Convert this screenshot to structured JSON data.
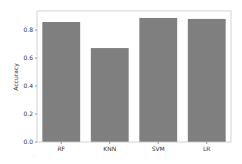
{
  "chart_data": {
    "type": "bar",
    "title": "",
    "xlabel": "",
    "ylabel": "Accuracy",
    "categories": [
      "RF",
      "KNN",
      "SVM",
      "LR"
    ],
    "values": [
      0.857,
      0.671,
      0.886,
      0.879
    ],
    "ylim": [
      0.0,
      0.93
    ],
    "yticks": [
      0.0,
      0.2,
      0.4,
      0.6,
      0.8
    ],
    "ytick_labels": [
      "0.0",
      "0.2",
      "0.4",
      "0.6",
      "0.8"
    ],
    "grid": false,
    "legend": null,
    "bar_color": "#7f7f7f",
    "axis_color": "#c8c8c8"
  }
}
